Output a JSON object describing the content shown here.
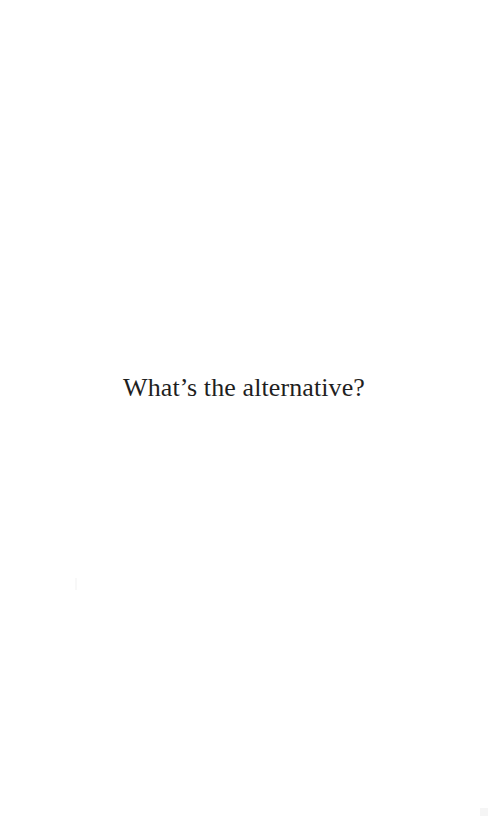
{
  "page": {
    "text": "What’s the alternative?"
  }
}
